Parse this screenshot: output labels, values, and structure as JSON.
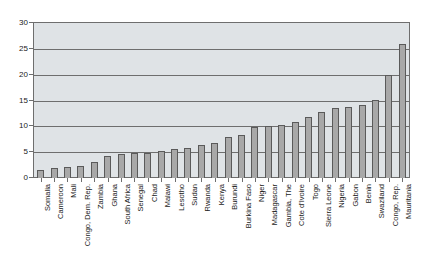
{
  "chart_data": {
    "type": "bar",
    "title": "",
    "xlabel": "",
    "ylabel": "",
    "ylim": [
      0,
      30
    ],
    "yticks": [
      0,
      5,
      10,
      15,
      20,
      25,
      30
    ],
    "grid": true,
    "legend": false,
    "orientation": "vertical",
    "sorted": "ascending",
    "bar_color": "#a8a8a8",
    "bar_edge_color": "#5a5a5a",
    "plot_background": "#dfe3e6",
    "axis_color": "#6e6e6e",
    "label_rotation": 90,
    "categories": [
      "Somalia",
      "Cameroon",
      "Mali",
      "Congo, Dem. Rep.",
      "Zambia",
      "Ghana",
      "South Africa",
      "Senegal",
      "Chad",
      "Malawi",
      "Lesotho",
      "Sudan",
      "Rwanda",
      "Kenya",
      "Burundi",
      "Burkina Faso",
      "Niger",
      "Madagascar",
      "Gambia, The",
      "Cote d'Ivoire",
      "Togo",
      "Sierra Leone",
      "Nigeria",
      "Gabon",
      "Benin",
      "Swaziland",
      "Congo, Rep.",
      "Mauritania"
    ],
    "values": [
      1.6,
      1.9,
      2.1,
      2.3,
      3.1,
      4.3,
      4.6,
      4.8,
      4.9,
      5.2,
      5.6,
      5.8,
      6.4,
      6.8,
      8.0,
      8.3,
      9.9,
      10.0,
      10.2,
      10.8,
      11.8,
      12.8,
      13.5,
      13.7,
      14.1,
      15.1,
      20.0,
      26.0
    ]
  }
}
